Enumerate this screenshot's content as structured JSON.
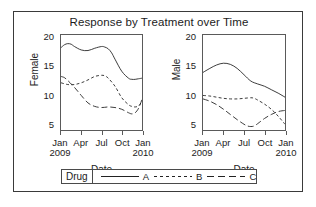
{
  "figure": {
    "title": "Response by Treatment over Time"
  },
  "legend": {
    "title": "Drug",
    "entries": [
      {
        "label": "A",
        "dash": "none"
      },
      {
        "label": "B",
        "dash": "short"
      },
      {
        "label": "C",
        "dash": "long"
      }
    ]
  },
  "chart_data": {
    "type": "line",
    "title": "Response by Treatment over Time",
    "xlabel": "Date",
    "grid": false,
    "legend_position": "bottom",
    "legend_title": "Drug",
    "x": [
      "Jan 2009",
      "Apr",
      "Jul",
      "Oct",
      "Jan 2010"
    ],
    "xtick_labels": [
      "Jan",
      "Apr",
      "Jul",
      "Oct",
      "Jan"
    ],
    "xtick_years": [
      "2009",
      "",
      "",
      "",
      "2010"
    ],
    "ytick_labels": [
      "5",
      "10",
      "15",
      "20"
    ],
    "ylim": [
      4.0,
      20.5
    ],
    "xlim": [
      0,
      12
    ],
    "panels": [
      {
        "name": "Female",
        "ylabel": "Female",
        "xlabel": "Date",
        "series": [
          {
            "name": "A",
            "dash": "none",
            "x": [
              0,
              0.5,
              1,
              1.5,
              2,
              3,
              4,
              5,
              6,
              6.5,
              7,
              7.5,
              8,
              9,
              10,
              10.5,
              11,
              11.5,
              12
            ],
            "values": [
              18.3,
              18.8,
              19.0,
              18.9,
              18.5,
              17.9,
              17.8,
              18.2,
              18.5,
              18.4,
              18.1,
              17.4,
              16.3,
              14.2,
              13.0,
              12.8,
              12.8,
              12.9,
              13.0
            ]
          },
          {
            "name": "B",
            "dash": "short",
            "x": [
              0,
              1,
              2,
              3,
              4,
              5,
              6,
              6.5,
              7,
              8,
              9,
              10,
              10.5,
              11,
              11.5,
              12
            ],
            "values": [
              12.2,
              11.9,
              11.9,
              12.2,
              12.7,
              13.3,
              13.5,
              13.4,
              13.0,
              11.6,
              9.6,
              8.4,
              8.1,
              8.0,
              8.2,
              9.0
            ]
          },
          {
            "name": "C",
            "dash": "long",
            "x": [
              0,
              0.5,
              1,
              2,
              3,
              4,
              5,
              6,
              7,
              8,
              9,
              10,
              10.5,
              11,
              11.5,
              12
            ],
            "values": [
              13.3,
              13.1,
              12.6,
              11.4,
              10.0,
              8.7,
              8.1,
              7.9,
              8.0,
              7.9,
              7.6,
              7.0,
              6.8,
              7.0,
              7.8,
              9.3
            ]
          }
        ]
      },
      {
        "name": "Male",
        "ylabel": "Male",
        "xlabel": "Date",
        "series": [
          {
            "name": "A",
            "dash": "none",
            "x": [
              0,
              1,
              2,
              3,
              4,
              5,
              6,
              7,
              8,
              9,
              10,
              11,
              12
            ],
            "values": [
              14.0,
              14.7,
              15.3,
              15.6,
              15.4,
              14.7,
              13.6,
              12.5,
              12.0,
              11.6,
              11.0,
              10.4,
              9.7
            ]
          },
          {
            "name": "B",
            "dash": "short",
            "x": [
              0,
              1,
              2,
              3,
              4,
              5,
              6,
              7,
              7.5,
              8,
              9,
              10,
              11,
              12
            ],
            "values": [
              10.0,
              9.9,
              9.7,
              9.5,
              9.4,
              9.4,
              9.5,
              9.6,
              9.5,
              9.2,
              8.5,
              7.6,
              6.4,
              5.0
            ]
          },
          {
            "name": "C",
            "dash": "long",
            "x": [
              0,
              1,
              2,
              3,
              4,
              5,
              6,
              6.5,
              7,
              7.5,
              8,
              9,
              10,
              11,
              12
            ],
            "values": [
              9.4,
              9.0,
              8.4,
              7.6,
              6.7,
              5.8,
              5.0,
              4.7,
              4.6,
              4.7,
              5.1,
              6.0,
              6.7,
              7.2,
              7.4
            ]
          }
        ]
      }
    ]
  }
}
